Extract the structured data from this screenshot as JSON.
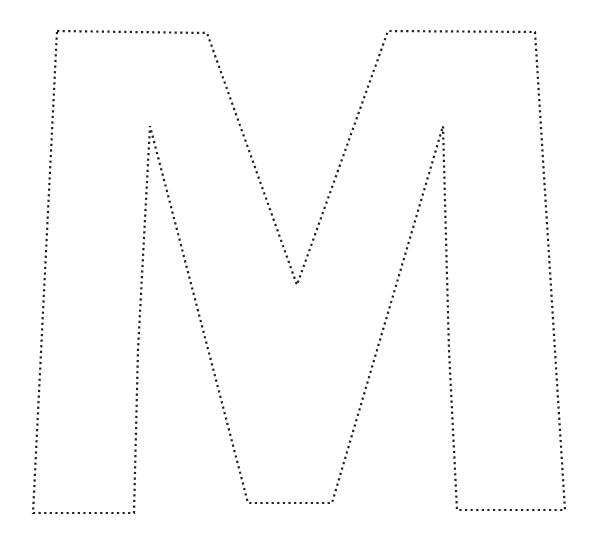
{
  "page": {
    "title": "Dotted Letter M Tracing Outline",
    "background_color": "#ffffff",
    "width": 597,
    "height": 538
  },
  "artwork": {
    "name": "letter-m-dotted-outline",
    "glyph": "M",
    "style": "dotted-outline",
    "stroke_color": "#1f1f1f",
    "stroke_width": 2.2,
    "dash_pattern": "2.2 3.4",
    "dash_linecap": "butt",
    "fill": "none",
    "closed": true,
    "outline_points": [
      [
        57,
        31
      ],
      [
        207,
        33
      ],
      [
        297,
        285
      ],
      [
        388,
        31
      ],
      [
        535,
        32
      ],
      [
        565,
        510
      ],
      [
        457,
        510
      ],
      [
        449,
        350
      ],
      [
        443,
        126
      ],
      [
        332,
        503
      ],
      [
        248,
        503
      ],
      [
        150,
        126
      ],
      [
        138,
        350
      ],
      [
        134,
        513
      ],
      [
        33,
        513
      ]
    ],
    "vertex_labels": [
      "top-left-outer",
      "top-left-inner",
      "apex-of-first-diagonal",
      "top-right-inner",
      "top-right-outer",
      "bottom-right-outer",
      "bottom-right-inner",
      "right-leg-mid",
      "right-peak-apex",
      "valley-right",
      "valley-left",
      "left-peak-apex",
      "left-leg-mid",
      "bottom-left-inner",
      "bottom-left-outer"
    ]
  },
  "chart_data": {
    "type": "line",
    "xlabel": "",
    "ylabel": "",
    "xlim": [
      0,
      597
    ],
    "ylim": [
      0,
      538
    ],
    "grid": false,
    "legend": "none",
    "series": [
      {
        "name": "letter-m-outline",
        "closed": true,
        "x": [
          57,
          207,
          297,
          388,
          535,
          565,
          457,
          449,
          443,
          332,
          248,
          150,
          138,
          134,
          33
        ],
        "y": [
          31,
          33,
          285,
          31,
          32,
          510,
          510,
          350,
          126,
          503,
          503,
          126,
          350,
          513,
          513
        ]
      }
    ]
  }
}
